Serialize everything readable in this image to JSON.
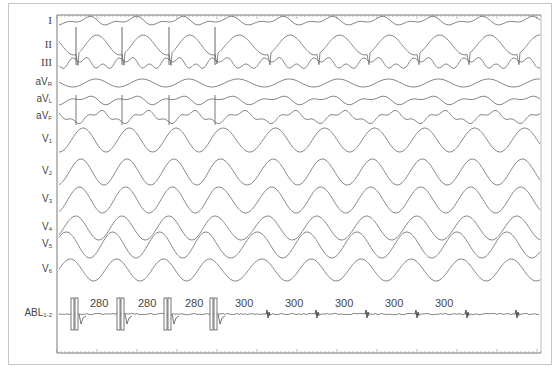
{
  "figure": {
    "type": "12-lead ECG with ablation catheter recording",
    "colors": {
      "trace": "#6a6a6a",
      "frame": "#c8c8c8",
      "axis": "#7a7a7a",
      "text": "#444444"
    }
  },
  "leads": [
    {
      "id": "I",
      "label": "I",
      "sub": "",
      "y": 21
    },
    {
      "id": "II",
      "label": "II",
      "sub": "",
      "y": 45
    },
    {
      "id": "III",
      "label": "III",
      "sub": "",
      "y": 63
    },
    {
      "id": "aVR",
      "label": "aV",
      "sub": "R",
      "y": 83
    },
    {
      "id": "aVL",
      "label": "aV",
      "sub": "L",
      "y": 100
    },
    {
      "id": "aVF",
      "label": "aV",
      "sub": "F",
      "y": 117
    },
    {
      "id": "V1",
      "label": "V",
      "sub": "1",
      "y": 140
    },
    {
      "id": "V2",
      "label": "V",
      "sub": "2",
      "y": 172
    },
    {
      "id": "V3",
      "label": "V",
      "sub": "3",
      "y": 200
    },
    {
      "id": "V4",
      "label": "V",
      "sub": "4",
      "y": 228
    },
    {
      "id": "V5",
      "label": "V",
      "sub": "5",
      "y": 245
    },
    {
      "id": "V6",
      "label": "V",
      "sub": "6",
      "y": 270
    },
    {
      "id": "ABL",
      "label": "ABL",
      "sub": "1-2",
      "y": 314
    }
  ],
  "chart_data": {
    "type": "line",
    "title": "",
    "xlabel": "time",
    "ylabel": "",
    "plot_area_px": {
      "left": 57,
      "top": 15,
      "right": 541,
      "bottom": 353
    },
    "pacing_spikes_x": [
      76,
      122,
      169,
      215
    ],
    "spontaneous_beats_x": [
      268,
      317,
      367,
      417,
      467,
      517
    ],
    "cycle_lengths_ms": [
      {
        "value": "280",
        "x": 90
      },
      {
        "value": "280",
        "x": 138
      },
      {
        "value": "280",
        "x": 185
      },
      {
        "value": "300",
        "x": 235
      },
      {
        "value": "300",
        "x": 285
      },
      {
        "value": "300",
        "x": 335
      },
      {
        "value": "300",
        "x": 385
      },
      {
        "value": "300",
        "x": 435
      }
    ],
    "annotations": [
      "Entrainment pacing at 280 ms followed by tachycardia at 300 ms"
    ],
    "grid": false
  }
}
